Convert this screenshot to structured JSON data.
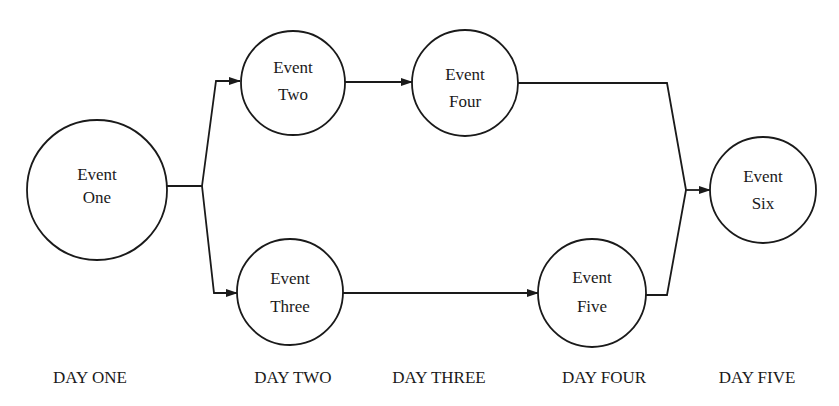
{
  "diagram": {
    "type": "event-network",
    "nodes": [
      {
        "id": "one",
        "line1": "Event",
        "line2": "One",
        "cx": 97,
        "cy": 190,
        "r": 70
      },
      {
        "id": "two",
        "line1": "Event",
        "line2": "Two",
        "cx": 293,
        "cy": 83,
        "r": 52
      },
      {
        "id": "three",
        "line1": "Event",
        "line2": "Three",
        "cx": 290,
        "cy": 292,
        "r": 53
      },
      {
        "id": "four",
        "line1": "Event",
        "line2": "Four",
        "cx": 465,
        "cy": 83,
        "r": 53
      },
      {
        "id": "five",
        "line1": "Event",
        "line2": "Five",
        "cx": 592,
        "cy": 293,
        "r": 54
      },
      {
        "id": "six",
        "line1": "Event",
        "line2": "Six",
        "cx": 763,
        "cy": 190,
        "r": 53
      }
    ],
    "edges": [
      {
        "from": "one",
        "to": "two"
      },
      {
        "from": "one",
        "to": "three"
      },
      {
        "from": "two",
        "to": "four"
      },
      {
        "from": "three",
        "to": "five"
      },
      {
        "from": "four",
        "to": "six"
      },
      {
        "from": "five",
        "to": "six"
      }
    ],
    "days": [
      {
        "label": "DAY ONE",
        "x": 90
      },
      {
        "label": "DAY TWO",
        "x": 293
      },
      {
        "label": "DAY THREE",
        "x": 439
      },
      {
        "label": "DAY FOUR",
        "x": 604
      },
      {
        "label": "DAY FIVE",
        "x": 757
      }
    ],
    "colors": {
      "ink": "#1a1a1a",
      "background": "#ffffff"
    }
  }
}
